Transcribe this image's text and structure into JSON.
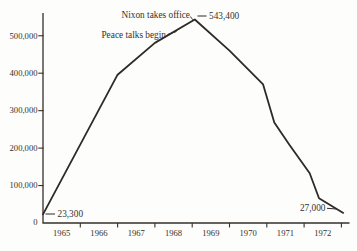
{
  "colors": {
    "background": "#fdfdfb",
    "ink": "#2e2b26",
    "text": "#35312b"
  },
  "chart_data": {
    "type": "line",
    "title": "",
    "xlabel": "",
    "ylabel": "",
    "x_tick_labels": [
      "1965",
      "1966",
      "1967",
      "1968",
      "1969",
      "1970",
      "1971",
      "1972"
    ],
    "x_boundary_years": [
      1966,
      1967,
      1968,
      1969,
      1970,
      1971,
      1972,
      1973
    ],
    "x_range_years": [
      1965,
      1973.2
    ],
    "y_ticks": [
      100000,
      200000,
      300000,
      400000,
      500000
    ],
    "y_tick_labels": [
      "0",
      "100,000",
      "200,000",
      "300,000",
      "400,000",
      "500,000"
    ],
    "ylim": [
      0,
      560000
    ],
    "grid": false,
    "legend": "none",
    "series": [
      {
        "name": "us-troop-levels",
        "points": [
          {
            "year": 1965.0,
            "value": 23300
          },
          {
            "year": 1967.0,
            "value": 396000
          },
          {
            "year": 1968.0,
            "value": 481000
          },
          {
            "year": 1969.07,
            "value": 543400
          },
          {
            "year": 1970.0,
            "value": 460000
          },
          {
            "year": 1970.9,
            "value": 370000
          },
          {
            "year": 1971.2,
            "value": 268000
          },
          {
            "year": 1971.6,
            "value": 210000
          },
          {
            "year": 1972.15,
            "value": 133000
          },
          {
            "year": 1972.4,
            "value": 66000
          },
          {
            "year": 1973.05,
            "value": 27000
          }
        ]
      }
    ],
    "key_values": {
      "start": "23,300",
      "peak": "543,400",
      "end": "27,000"
    },
    "annotations": [
      {
        "name": "start-value-label",
        "text": "23,300",
        "x": 57.5,
        "y": 214,
        "ha": "start",
        "leader": "M45.5,214 L55,214"
      },
      {
        "name": "peace-talks-label",
        "text": "Peace talks begin",
        "x": 166,
        "y": 34.5,
        "ha": "end",
        "leader": "M167.5,34.5 L176.5,31.5"
      },
      {
        "name": "nixon-label",
        "text": "Nixon takes office",
        "x": 190,
        "y": 15,
        "ha": "end",
        "leader": "M190.5,16.5 C193,20.5 193,20 195,19.5"
      },
      {
        "name": "peak-value-label",
        "text": "543,400",
        "x": 209,
        "y": 15.5,
        "ha": "start",
        "leader": "M197.5,16 L206.5,16"
      },
      {
        "name": "end-value-label",
        "text": "27,000",
        "x": 325.5,
        "y": 208,
        "ha": "end",
        "leader": "M327,208.3 L336.5,209"
      }
    ]
  }
}
